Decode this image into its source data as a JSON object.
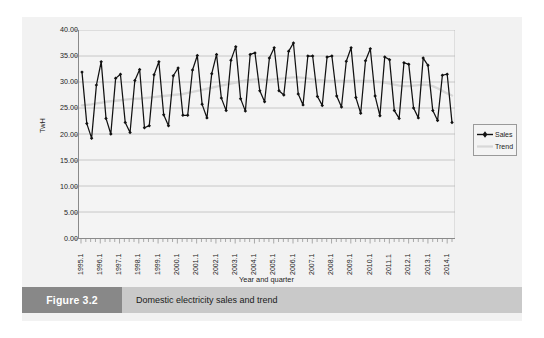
{
  "figure": {
    "tag": "Figure 3.2",
    "caption": "Domestic electricity sales and trend"
  },
  "legend": {
    "position": "right",
    "items": [
      {
        "label": "Sales",
        "color": "#111111",
        "marker": "diamond"
      },
      {
        "label": "Trend",
        "color": "#d8d8d8",
        "marker": "none"
      }
    ]
  },
  "chart_data": {
    "type": "line",
    "title": "",
    "subtitle": "",
    "xlabel": "Year and quarter",
    "ylabel": "TwH",
    "ylim": [
      0,
      40
    ],
    "yticks": [
      "0.00",
      "5.00",
      "10.00",
      "15.00",
      "20.00",
      "25.00",
      "30.00",
      "35.00",
      "40.00"
    ],
    "ytick_values": [
      0,
      5,
      10,
      15,
      20,
      25,
      30,
      35,
      40
    ],
    "grid": "horizontal",
    "xtick_labels": [
      "1995.1",
      "1996.1",
      "1997.1",
      "1998.1",
      "1999.1",
      "2000.1",
      "2001.1",
      "2002.1",
      "2003.1",
      "2004.1",
      "2005.1",
      "2006.1",
      "2007.1",
      "2008.1",
      "2009.1",
      "2010.1",
      "2011.1",
      "2012.1",
      "2013.1",
      "2014.1"
    ],
    "xtick_interval_quarters": 4,
    "x": [
      "1995.1",
      "1995.2",
      "1995.3",
      "1995.4",
      "1996.1",
      "1996.2",
      "1996.3",
      "1996.4",
      "1997.1",
      "1997.2",
      "1997.3",
      "1997.4",
      "1998.1",
      "1998.2",
      "1998.3",
      "1998.4",
      "1999.1",
      "1999.2",
      "1999.3",
      "1999.4",
      "2000.1",
      "2000.2",
      "2000.3",
      "2000.4",
      "2001.1",
      "2001.2",
      "2001.3",
      "2001.4",
      "2002.1",
      "2002.2",
      "2002.3",
      "2002.4",
      "2003.1",
      "2003.2",
      "2003.3",
      "2003.4",
      "2004.1",
      "2004.2",
      "2004.3",
      "2004.4",
      "2005.1",
      "2005.2",
      "2005.3",
      "2005.4",
      "2006.1",
      "2006.2",
      "2006.3",
      "2006.4",
      "2007.1",
      "2007.2",
      "2007.3",
      "2007.4",
      "2008.1",
      "2008.2",
      "2008.3",
      "2008.4",
      "2009.1",
      "2009.2",
      "2009.3",
      "2009.4",
      "2010.1",
      "2010.2",
      "2010.3",
      "2010.4",
      "2011.1",
      "2011.2",
      "2011.3",
      "2011.4",
      "2012.1",
      "2012.2",
      "2012.3",
      "2012.4",
      "2013.1",
      "2013.2",
      "2013.3",
      "2013.4",
      "2014.1",
      "2014.2"
    ],
    "series": [
      {
        "name": "Sales",
        "color": "#111111",
        "marker": "diamond",
        "values": [
          31.9,
          22.0,
          19.2,
          29.4,
          33.9,
          23.0,
          20.0,
          30.7,
          31.5,
          22.2,
          20.3,
          30.3,
          32.4,
          21.2,
          21.6,
          31.4,
          33.9,
          23.7,
          21.6,
          31.2,
          32.7,
          23.6,
          23.6,
          32.3,
          35.1,
          25.7,
          23.1,
          31.6,
          35.3,
          26.9,
          24.5,
          34.2,
          36.8,
          26.8,
          24.4,
          35.3,
          35.6,
          28.3,
          26.2,
          34.6,
          36.6,
          28.3,
          27.5,
          35.9,
          37.5,
          27.7,
          25.6,
          35.0,
          35.0,
          27.2,
          25.5,
          34.8,
          35.0,
          27.3,
          25.2,
          34.0,
          36.6,
          27.0,
          24.0,
          34.1,
          36.4,
          27.3,
          23.5,
          34.8,
          34.3,
          24.5,
          23.0,
          33.7,
          33.4,
          25.0,
          23.1,
          34.6,
          33.2,
          24.5,
          22.6,
          31.3,
          31.5,
          22.2
        ]
      },
      {
        "name": "Trend",
        "color": "#d8d8d8",
        "marker": "none",
        "values": [
          25.5,
          25.6,
          25.7,
          25.9,
          26.0,
          26.2,
          26.3,
          26.4,
          26.5,
          26.6,
          26.7,
          26.8,
          26.8,
          26.9,
          27.0,
          27.1,
          27.2,
          27.3,
          27.4,
          27.5,
          27.6,
          27.7,
          27.9,
          28.1,
          28.3,
          28.5,
          28.7,
          28.9,
          29.1,
          29.3,
          29.5,
          29.7,
          29.9,
          30.1,
          30.3,
          30.4,
          30.5,
          30.5,
          30.4,
          30.4,
          30.5,
          30.6,
          30.7,
          30.8,
          30.9,
          30.9,
          30.8,
          30.7,
          30.5,
          30.4,
          30.3,
          30.2,
          30.2,
          30.2,
          30.2,
          30.2,
          30.2,
          30.2,
          30.2,
          30.2,
          30.2,
          30.1,
          30.0,
          29.9,
          29.7,
          29.5,
          29.3,
          29.2,
          29.2,
          29.3,
          29.4,
          29.5,
          29.4,
          29.2,
          28.8,
          28.3,
          27.8,
          27.4
        ]
      }
    ]
  }
}
